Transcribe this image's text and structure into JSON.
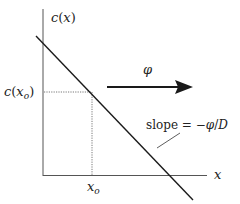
{
  "diagram": {
    "y_axis_label": {
      "fn": "c",
      "arg": "x"
    },
    "x_axis_label": "x",
    "point_y_label": {
      "fn": "c",
      "arg": "x",
      "sub": "o"
    },
    "point_x_label": {
      "var": "x",
      "sub": "o"
    },
    "flux_label": "φ",
    "slope_label": {
      "prefix": "slope = −",
      "phi": "φ",
      "slash": "/",
      "D": "D"
    },
    "colors": {
      "line": "#1a1a1a",
      "axis": "#555555",
      "dotted": "#555555",
      "arrow": "#1a1a1a"
    }
  }
}
